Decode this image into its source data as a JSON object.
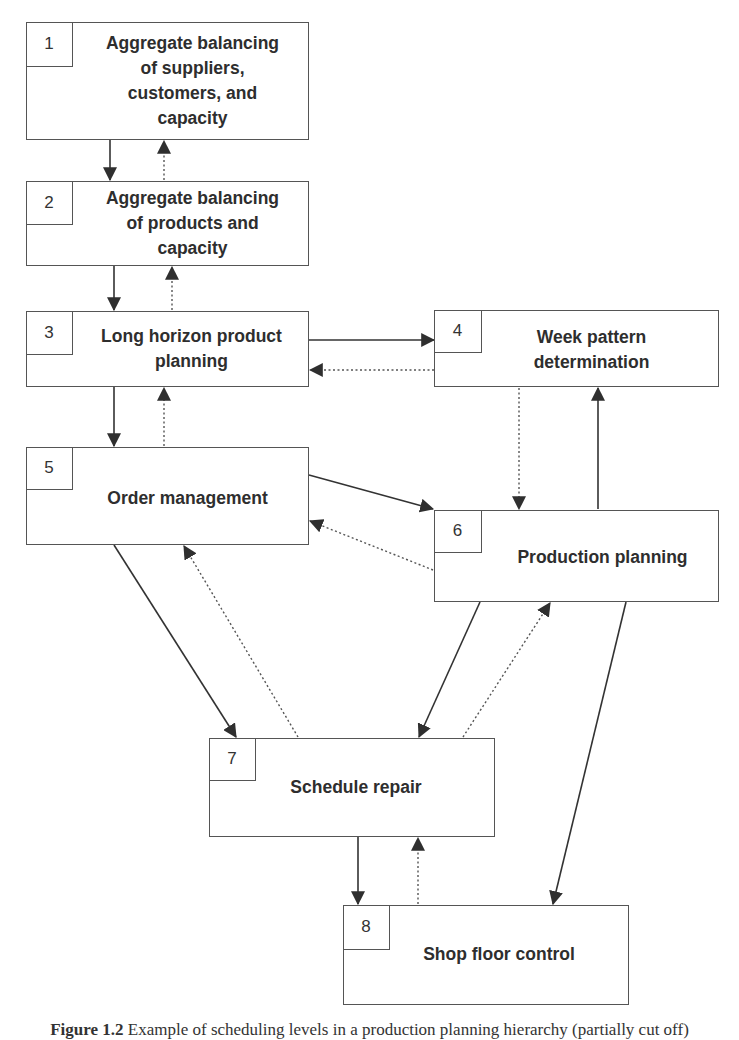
{
  "diagram": {
    "boxes": [
      {
        "id": 1,
        "number": "1",
        "label": "Aggregate balancing\nof suppliers,\ncustomers, and\ncapacity"
      },
      {
        "id": 2,
        "number": "2",
        "label": "Aggregate balancing\nof products and\ncapacity"
      },
      {
        "id": 3,
        "number": "3",
        "label": "Long horizon product\nplanning"
      },
      {
        "id": 4,
        "number": "4",
        "label": "Week pattern\ndetermination"
      },
      {
        "id": 5,
        "number": "5",
        "label": "Order management"
      },
      {
        "id": 6,
        "number": "6",
        "label": "Production planning"
      },
      {
        "id": 7,
        "number": "7",
        "label": "Schedule repair"
      },
      {
        "id": 8,
        "number": "8",
        "label": "Shop floor control"
      }
    ],
    "edges": [
      {
        "from": 1,
        "to": 2,
        "style": "solid"
      },
      {
        "from": 2,
        "to": 1,
        "style": "dotted"
      },
      {
        "from": 2,
        "to": 3,
        "style": "solid"
      },
      {
        "from": 3,
        "to": 2,
        "style": "dotted"
      },
      {
        "from": 3,
        "to": 4,
        "style": "solid"
      },
      {
        "from": 4,
        "to": 3,
        "style": "dotted"
      },
      {
        "from": 3,
        "to": 5,
        "style": "solid"
      },
      {
        "from": 5,
        "to": 3,
        "style": "dotted"
      },
      {
        "from": 4,
        "to": 6,
        "style": "dotted"
      },
      {
        "from": 6,
        "to": 4,
        "style": "solid"
      },
      {
        "from": 5,
        "to": 6,
        "style": "solid"
      },
      {
        "from": 6,
        "to": 5,
        "style": "dotted"
      },
      {
        "from": 5,
        "to": 7,
        "style": "solid"
      },
      {
        "from": 7,
        "to": 5,
        "style": "dotted"
      },
      {
        "from": 6,
        "to": 7,
        "style": "solid"
      },
      {
        "from": 7,
        "to": 6,
        "style": "dotted"
      },
      {
        "from": 6,
        "to": 8,
        "style": "solid"
      },
      {
        "from": 7,
        "to": 8,
        "style": "solid"
      },
      {
        "from": 8,
        "to": 7,
        "style": "dotted"
      }
    ],
    "legend": {
      "solid": "solid arrow",
      "dotted": "dotted arrow"
    }
  },
  "caption": {
    "prefix": "Figure 1.2",
    "text": "Example of scheduling levels in a production planning hierarchy (partially cut off)"
  },
  "colors": {
    "line": "#333333",
    "border": "#555555",
    "text": "#2e2e2e"
  }
}
